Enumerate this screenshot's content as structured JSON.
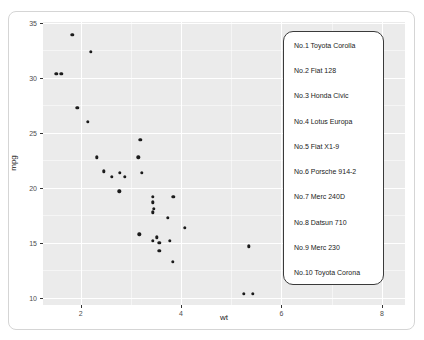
{
  "chart_data": {
    "type": "scatter",
    "title": "",
    "xlabel": "wt",
    "ylabel": "mpg",
    "xlim": [
      1.25,
      8.46
    ],
    "ylim": [
      9.36,
      35.09
    ],
    "x_ticks": [
      2,
      4,
      6,
      8
    ],
    "y_ticks": [
      10,
      15,
      20,
      25,
      30,
      35
    ],
    "x_minor_ticks": [
      3,
      5,
      7
    ],
    "y_minor_ticks": [
      12.5,
      17.5,
      22.5,
      27.5,
      32.5
    ],
    "grid": "major-and-minor",
    "legend_position": "inside-top-right",
    "colors": {
      "panel_bg": "#EBEBEB",
      "gridline": "#FFFFFF",
      "point": "#1B1B1B",
      "tick_label": "#4D4D4D",
      "axis_title": "#1A1A1A",
      "legend_bg": "#FFFFFF",
      "legend_border": "#3A3A3A",
      "figure_border": "#D5D5D5"
    },
    "points": [
      {
        "name": "Mazda RX4",
        "wt": 2.62,
        "mpg": 21.0
      },
      {
        "name": "Mazda RX4 Wag",
        "wt": 2.875,
        "mpg": 21.0
      },
      {
        "name": "Datsun 710",
        "wt": 2.32,
        "mpg": 22.8
      },
      {
        "name": "Hornet 4 Drive",
        "wt": 3.215,
        "mpg": 21.4
      },
      {
        "name": "Hornet Sportabout",
        "wt": 3.44,
        "mpg": 18.7
      },
      {
        "name": "Valiant",
        "wt": 3.46,
        "mpg": 18.1
      },
      {
        "name": "Duster 360",
        "wt": 3.57,
        "mpg": 14.3
      },
      {
        "name": "Merc 240D",
        "wt": 3.19,
        "mpg": 24.4
      },
      {
        "name": "Merc 230",
        "wt": 3.15,
        "mpg": 22.8
      },
      {
        "name": "Merc 280",
        "wt": 3.44,
        "mpg": 19.2
      },
      {
        "name": "Merc 280C",
        "wt": 3.44,
        "mpg": 17.8
      },
      {
        "name": "Merc 450SE",
        "wt": 4.07,
        "mpg": 16.4
      },
      {
        "name": "Merc 450SL",
        "wt": 3.73,
        "mpg": 17.3
      },
      {
        "name": "Merc 450SLC",
        "wt": 3.78,
        "mpg": 15.2
      },
      {
        "name": "Cadillac Fleetwood",
        "wt": 5.25,
        "mpg": 10.4
      },
      {
        "name": "Lincoln Continental",
        "wt": 5.424,
        "mpg": 10.4
      },
      {
        "name": "Chrysler Imperial",
        "wt": 5.345,
        "mpg": 14.7
      },
      {
        "name": "Fiat 128",
        "wt": 2.2,
        "mpg": 32.4
      },
      {
        "name": "Honda Civic",
        "wt": 1.615,
        "mpg": 30.4
      },
      {
        "name": "Toyota Corolla",
        "wt": 1.835,
        "mpg": 33.9
      },
      {
        "name": "Toyota Corona",
        "wt": 2.465,
        "mpg": 21.5
      },
      {
        "name": "Dodge Challenger",
        "wt": 3.52,
        "mpg": 15.5
      },
      {
        "name": "AMC Javelin",
        "wt": 3.435,
        "mpg": 15.2
      },
      {
        "name": "Camaro Z28",
        "wt": 3.84,
        "mpg": 13.3
      },
      {
        "name": "Pontiac Firebird",
        "wt": 3.845,
        "mpg": 19.2
      },
      {
        "name": "Fiat X1-9",
        "wt": 1.935,
        "mpg": 27.3
      },
      {
        "name": "Porsche 914-2",
        "wt": 2.14,
        "mpg": 26.0
      },
      {
        "name": "Lotus Europa",
        "wt": 1.513,
        "mpg": 30.4
      },
      {
        "name": "Ford Pantera L",
        "wt": 3.17,
        "mpg": 15.8
      },
      {
        "name": "Ferrari Dino",
        "wt": 2.77,
        "mpg": 19.7
      },
      {
        "name": "Maserati Bora",
        "wt": 3.57,
        "mpg": 15.0
      },
      {
        "name": "Volvo 142E",
        "wt": 2.78,
        "mpg": 21.4
      }
    ]
  },
  "legend": {
    "items": [
      "No.1 Toyota Corolla",
      "No.2 Fiat 128",
      "No.3 Honda Civic",
      "No.4 Lotus Europa",
      "No.5 Fiat X1-9",
      "No.6 Porsche 914-2",
      "No.7 Merc 240D",
      "No.8 Datsun 710",
      "No.9 Merc 230",
      "No.10 Toyota Corona"
    ]
  }
}
